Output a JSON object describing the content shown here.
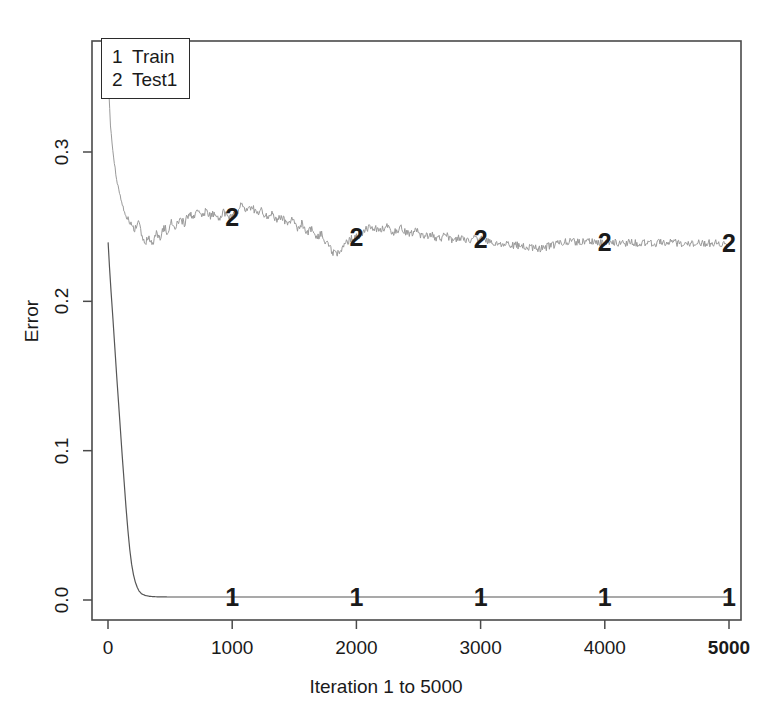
{
  "chart_data": {
    "type": "line",
    "title": "",
    "xlabel": "Iteration 1 to 5000",
    "ylabel": "Error",
    "xlim": [
      1,
      5000
    ],
    "ylim": [
      -0.012,
      0.352
    ],
    "grid": false,
    "legend_position": "top-left",
    "xticks": [
      0,
      1000,
      2000,
      3000,
      4000,
      5000
    ],
    "xtick_labels": [
      "0",
      "1000",
      "2000",
      "3000",
      "4000",
      "5000"
    ],
    "yticks": [
      0.0,
      0.1,
      0.2,
      0.3
    ],
    "ytick_labels": [
      "0.0",
      "0.1",
      "0.2",
      "0.3"
    ],
    "series": [
      {
        "name": "Train",
        "key": "1",
        "color": "#555555",
        "marker_label": "1",
        "marker_x": [
          1000,
          2000,
          3000,
          4000,
          5000
        ],
        "marker_y": [
          0.002,
          0.002,
          0.002,
          0.002,
          0.002
        ],
        "x": [
          1,
          12,
          25,
          40,
          55,
          70,
          85,
          100,
          115,
          130,
          145,
          160,
          175,
          190,
          205,
          220,
          235,
          250,
          270,
          300,
          340,
          400,
          500,
          700,
          1000,
          1500,
          2000,
          2500,
          3000,
          3500,
          4000,
          4500,
          5000
        ],
        "y": [
          0.2395,
          0.223,
          0.206,
          0.188,
          0.169,
          0.15,
          0.132,
          0.114,
          0.096,
          0.079,
          0.062,
          0.047,
          0.034,
          0.024,
          0.017,
          0.012,
          0.0085,
          0.006,
          0.0042,
          0.003,
          0.0024,
          0.0021,
          0.002,
          0.002,
          0.002,
          0.002,
          0.002,
          0.002,
          0.002,
          0.002,
          0.002,
          0.002,
          0.002
        ]
      },
      {
        "name": "Test1",
        "key": "2",
        "color": "#9a9a9a",
        "marker_label": "2",
        "marker_x": [
          1000,
          2000,
          3000,
          4000,
          5000
        ],
        "marker_y": [
          0.2565,
          0.243,
          0.2415,
          0.2395,
          0.239
        ],
        "x": [
          1,
          20,
          45,
          75,
          110,
          150,
          185,
          215,
          245,
          275,
          300,
          330,
          360,
          390,
          420,
          450,
          480,
          510,
          545,
          580,
          615,
          650,
          685,
          720,
          755,
          790,
          825,
          860,
          895,
          930,
          965,
          1000,
          1040,
          1080,
          1120,
          1160,
          1200,
          1240,
          1280,
          1320,
          1360,
          1400,
          1440,
          1480,
          1520,
          1560,
          1600,
          1640,
          1680,
          1720,
          1760,
          1800,
          1840,
          1880,
          1920,
          1960,
          2000,
          2060,
          2120,
          2180,
          2240,
          2300,
          2360,
          2420,
          2480,
          2540,
          2600,
          2660,
          2720,
          2780,
          2840,
          2900,
          2960,
          3000,
          3080,
          3160,
          3240,
          3320,
          3400,
          3480,
          3560,
          3640,
          3720,
          3800,
          3880,
          3960,
          4000,
          4120,
          4240,
          4360,
          4480,
          4600,
          4720,
          4840,
          5000
        ],
        "y": [
          0.352,
          0.318,
          0.296,
          0.279,
          0.266,
          0.2555,
          0.252,
          0.247,
          0.256,
          0.244,
          0.239,
          0.243,
          0.238,
          0.247,
          0.242,
          0.25,
          0.246,
          0.254,
          0.25,
          0.256,
          0.252,
          0.259,
          0.256,
          0.26,
          0.257,
          0.261,
          0.257,
          0.26,
          0.256,
          0.26,
          0.257,
          0.2565,
          0.26,
          0.265,
          0.26,
          0.263,
          0.258,
          0.261,
          0.256,
          0.259,
          0.254,
          0.257,
          0.252,
          0.255,
          0.249,
          0.252,
          0.246,
          0.249,
          0.243,
          0.245,
          0.239,
          0.234,
          0.231,
          0.235,
          0.24,
          0.242,
          0.243,
          0.247,
          0.25,
          0.247,
          0.25,
          0.246,
          0.249,
          0.245,
          0.247,
          0.243,
          0.245,
          0.242,
          0.244,
          0.241,
          0.243,
          0.24,
          0.242,
          0.2415,
          0.24,
          0.239,
          0.238,
          0.237,
          0.236,
          0.2355,
          0.237,
          0.239,
          0.24,
          0.2395,
          0.24,
          0.2395,
          0.2395,
          0.239,
          0.2392,
          0.239,
          0.2392,
          0.239,
          0.239,
          0.239,
          0.239
        ]
      }
    ]
  },
  "legend": {
    "entries": [
      {
        "key": "1",
        "label": "Train"
      },
      {
        "key": "2",
        "label": "Test1"
      }
    ]
  }
}
